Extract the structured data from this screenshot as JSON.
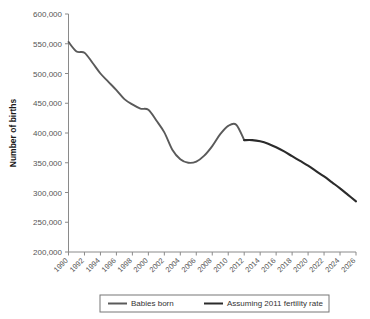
{
  "chart_data": {
    "type": "line",
    "title": "",
    "xlabel": "",
    "ylabel": "Number of births",
    "ylim": [
      200000,
      600000
    ],
    "xlim": [
      1990,
      2026
    ],
    "grid": false,
    "legend_position": "bottom",
    "ytick_labels": [
      "200,000",
      "250,000",
      "300,000",
      "350,000",
      "400,000",
      "450,000",
      "500,000",
      "550,000",
      "600,000"
    ],
    "ytick_values": [
      200000,
      250000,
      300000,
      350000,
      400000,
      450000,
      500000,
      550000,
      600000
    ],
    "xtick_labels": [
      "1990",
      "1992",
      "1994",
      "1996",
      "1998",
      "2000",
      "2002",
      "2004",
      "2006",
      "2008",
      "2010",
      "2012",
      "2014",
      "2016",
      "2018",
      "2020",
      "2022",
      "2024",
      "2026"
    ],
    "xtick_values": [
      1990,
      1992,
      1994,
      1996,
      1998,
      2000,
      2002,
      2004,
      2006,
      2008,
      2010,
      2012,
      2014,
      2016,
      2018,
      2020,
      2022,
      2024,
      2026
    ],
    "series": [
      {
        "name": "Babies born",
        "color": "#5a5a5a",
        "x": [
          1990,
          1991,
          1992,
          1993,
          1994,
          1995,
          1996,
          1997,
          1998,
          1999,
          2000,
          2001,
          2002,
          2003,
          2004,
          2005,
          2006,
          2007,
          2008,
          2009,
          2010,
          2011,
          2012
        ],
        "values": [
          553000,
          537000,
          535000,
          518000,
          500000,
          486000,
          472000,
          457000,
          448000,
          441000,
          439000,
          421000,
          401000,
          372000,
          356000,
          350000,
          352000,
          362000,
          378000,
          398000,
          412000,
          414000,
          388000
        ]
      },
      {
        "name": "Assuming 2011 fertility rate",
        "color": "#2b2b2b",
        "x": [
          2012,
          2013,
          2014,
          2015,
          2016,
          2017,
          2018,
          2019,
          2020,
          2021,
          2022,
          2023,
          2024,
          2025,
          2026
        ],
        "values": [
          388000,
          388000,
          386000,
          382000,
          376000,
          369000,
          361000,
          353000,
          345000,
          336000,
          327000,
          317000,
          307000,
          296000,
          285000
        ]
      }
    ],
    "legend": [
      {
        "label": "Babies born",
        "color": "#5a5a5a"
      },
      {
        "label": "Assuming 2011 fertility rate",
        "color": "#2b2b2b"
      }
    ]
  },
  "colors": {
    "background": "#ffffff",
    "axis": "#8a8a8a",
    "tick_text": "#555555",
    "axis_title": "#1a1a1a",
    "legend_border": "#777777",
    "series_historical": "#5a5a5a",
    "series_projection": "#2b2b2b"
  }
}
